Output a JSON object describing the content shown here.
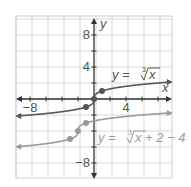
{
  "chart_data": {
    "type": "line",
    "title": "",
    "xlabel": "x",
    "ylabel": "y",
    "xlim": [
      -9.75,
      9.75
    ],
    "ylim": [
      -9.9,
      10.4
    ],
    "grid": true,
    "grid_step": 2,
    "x_tick_labels": [
      {
        "value": -8,
        "label": "−8"
      },
      {
        "value": 4,
        "label": "4"
      }
    ],
    "y_tick_labels": [
      {
        "value": 8,
        "label": "8"
      },
      {
        "value": 4,
        "label": "4"
      },
      {
        "value": -8,
        "label": "−8"
      }
    ],
    "series": [
      {
        "name": "y = ∛x",
        "label_left": "y = ",
        "label_right": "x",
        "label_index": "3",
        "color": "#555555",
        "function": "cbrt(x)",
        "points": [
          [
            -1,
            -1
          ],
          [
            0,
            0
          ],
          [
            1,
            1
          ]
        ]
      },
      {
        "name": "y = ∛(x + 2) − 4",
        "label_left": "y = ",
        "label_right": "x + 2 − 4",
        "label_index": "3",
        "color": "#9a9a9a",
        "function": "cbrt(x+2)-4",
        "points": [
          [
            -3,
            -5
          ],
          [
            -2,
            -4
          ],
          [
            -1,
            -3
          ]
        ]
      }
    ]
  }
}
